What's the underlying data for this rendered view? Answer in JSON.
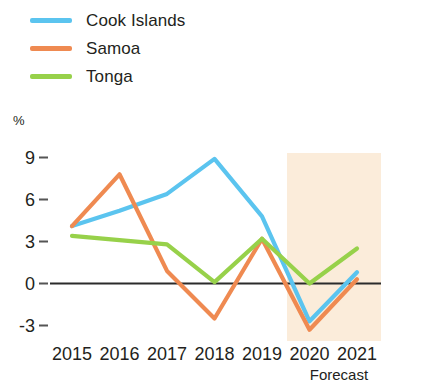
{
  "chart_data": {
    "type": "line",
    "title": "",
    "subtitle": "",
    "xlabel": "",
    "ylabel": "%",
    "categories": [
      "2015",
      "2016",
      "2017",
      "2018",
      "2019",
      "2020",
      "2021"
    ],
    "yticks": [
      9,
      6,
      3,
      0,
      -3
    ],
    "ylim": [
      -4.2,
      10.0
    ],
    "grid": false,
    "legend_position": "top-left",
    "zero_line": true,
    "annotations": [
      {
        "text": "Forecast",
        "type": "shaded-region-label",
        "x_from": "2019.5",
        "x_to": "2021"
      }
    ],
    "forecast_region": {
      "label": "Forecast",
      "start": "2019.5",
      "end": "2021",
      "color": "#fae9d4"
    },
    "series": [
      {
        "name": "Cook Islands",
        "color": "#5bc4ef",
        "values": [
          4.1,
          5.2,
          6.4,
          8.9,
          4.8,
          -2.7,
          0.8
        ]
      },
      {
        "name": "Samoa",
        "color": "#ef8a51",
        "values": [
          4.1,
          7.8,
          0.9,
          -2.5,
          3.2,
          -3.3,
          0.3
        ]
      },
      {
        "name": "Tonga",
        "color": "#97d14a",
        "values": [
          3.4,
          3.1,
          2.8,
          0.1,
          3.2,
          0.0,
          2.5
        ]
      }
    ]
  },
  "legend": {
    "items": [
      {
        "label": "Cook Islands",
        "color": "#5bc4ef"
      },
      {
        "label": "Samoa",
        "color": "#ef8a51"
      },
      {
        "label": "Tonga",
        "color": "#97d14a"
      }
    ]
  },
  "axis": {
    "unit": "%",
    "y_tick_labels": [
      "9",
      "6",
      "3",
      "0",
      "-3"
    ],
    "x_tick_labels": [
      "2015",
      "2016",
      "2017",
      "2018",
      "2019",
      "2020",
      "2021"
    ],
    "forecast_label": "Forecast"
  }
}
